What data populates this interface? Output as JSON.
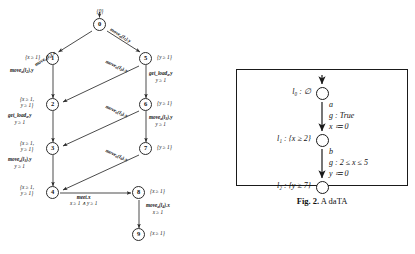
{
  "left_graph": {
    "title_label": "{0}",
    "nodes": [
      {
        "id": "0",
        "label": "0",
        "invariant": "{0}"
      },
      {
        "id": "1",
        "label": "1",
        "invariant": "{x ≥ 1}"
      },
      {
        "id": "2",
        "label": "2",
        "invariant": "{x ≥ 1,\ny ≥ 1}"
      },
      {
        "id": "3",
        "label": "3",
        "invariant": "{x ≥ 1,\ny ≥ 1}"
      },
      {
        "id": "4",
        "label": "4",
        "invariant": "{x ≥ 1,\ny ≥ 1}"
      },
      {
        "id": "5",
        "label": "5",
        "invariant": "{y ≥ 1}"
      },
      {
        "id": "6",
        "label": "6",
        "invariant": "{y ≥ 1}"
      },
      {
        "id": "7",
        "label": "7",
        "invariant": "{y ≥ 1}"
      },
      {
        "id": "8",
        "label": "8",
        "invariant": "{x ≥ 1}"
      },
      {
        "id": "9",
        "label": "9",
        "invariant": "{x ≥ 1}"
      }
    ],
    "edges": [
      {
        "from": "0",
        "to": "1",
        "action": "move_a(l_1).x",
        "guard": ""
      },
      {
        "from": "0",
        "to": "5",
        "action": "move_a(l_1).y",
        "guard": ""
      },
      {
        "from": "1",
        "to": "2",
        "action": "move_a(l_2).y",
        "guard": ""
      },
      {
        "from": "5",
        "to": "2",
        "action": "move_a(l_2).x",
        "guard": ""
      },
      {
        "from": "5",
        "to": "6",
        "action": "get_load_a.y",
        "guard": "y ≥ 1"
      },
      {
        "from": "2",
        "to": "3",
        "action": "get_load_a.y",
        "guard": "y ≥ 1"
      },
      {
        "from": "3",
        "to": "4",
        "action": "move_a(l_3).y",
        "guard": "y ≥ 1"
      },
      {
        "from": "6",
        "to": "3",
        "action": "move_a(l_3).x",
        "guard": ""
      },
      {
        "from": "6",
        "to": "7",
        "action": "move_a(l_3).y",
        "guard": "y ≥ 1"
      },
      {
        "from": "7",
        "to": "4",
        "action": "move_a(l_3).x",
        "guard": ""
      },
      {
        "from": "4",
        "to": "8",
        "action": "meet.x",
        "guard": "x ≥ 1 ∧ y ≥ 1"
      },
      {
        "from": "8",
        "to": "9",
        "action": "move_a(l_4).x",
        "guard": "x ≥ 1"
      }
    ],
    "edge_labels": {
      "e0_1_action": "move",
      "e0_1_sub": "a",
      "e0_1_arg": "(l",
      "e0_1_argsub": "1",
      "e0_1_tail": ").x",
      "e0_5_tail": ").y",
      "l_0_1": "move",
      "l_0_5": "move",
      "l_1_2": "move",
      "l_5_2": "move",
      "l_5_6_a": "get_load",
      "l_5_6_g": "y ≥ 1",
      "l_2_3_a": "get_load",
      "l_2_3_g": "y ≥ 1",
      "l_3_4_a": "move",
      "l_3_4_g": "y ≥ 1",
      "l_6_3": "move",
      "l_6_7_a": "move",
      "l_6_7_g": "y ≥ 1",
      "l_7_4": "move",
      "l_4_8_a": "meet.x",
      "l_4_8_g": "x ≥ 1 ∧ y ≥ 1",
      "l_8_9_a": "move",
      "l_8_9_g": "x ≥ 1"
    }
  },
  "right_panel": {
    "locations": [
      {
        "name": "l₀ : ∅"
      },
      {
        "name": "l₁ : {x ≥ 2}"
      },
      {
        "name": "l₂ : {y ≥ 7}"
      }
    ],
    "transitions": [
      {
        "action": "a",
        "guard": "g : True",
        "reset": "x ≔ 0"
      },
      {
        "action": "b",
        "guard": "g : 2 ≤ x ≤ 5",
        "reset": "y ≔ 0"
      }
    ]
  },
  "caption": {
    "prefix": "Fig. 2.",
    "text": "A daTA"
  }
}
